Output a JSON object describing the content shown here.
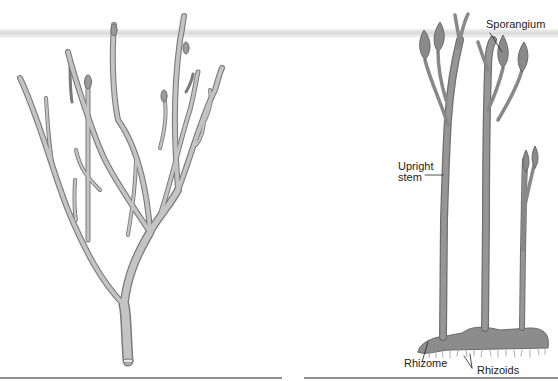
{
  "figure": {
    "left_panel": {
      "description": "branching plant (dichotomous branching)"
    },
    "right_panel": {
      "labels": {
        "sporangium": "Sporangium",
        "upright_stem_line1": "Upright",
        "upright_stem_line2": "stem",
        "rhizome": "Rhizome",
        "rhizoids": "Rhizoids"
      }
    }
  },
  "colors": {
    "stem_fill": "#a9a9a9",
    "stem_dark": "#7a7a7a",
    "right_stem_fill": "#8f8f8f",
    "rule": "#8e8e8e"
  }
}
